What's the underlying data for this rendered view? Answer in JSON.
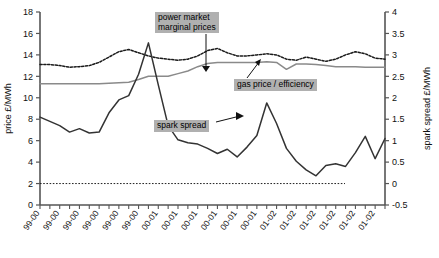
{
  "chart_data": {
    "type": "line",
    "title": "",
    "xlabel": "",
    "ylabel": "price £/MWh",
    "y2label": "spark spread £/MWh",
    "ylim": [
      0,
      18
    ],
    "y2lim": [
      -0.5,
      4
    ],
    "yticks": [
      0,
      2,
      4,
      6,
      8,
      10,
      12,
      14,
      16,
      18
    ],
    "y2ticks": [
      -0.5,
      0,
      0.5,
      1,
      1.5,
      2,
      2.5,
      3,
      3.5,
      4
    ],
    "grid": false,
    "legend_position": "inline-callouts",
    "categories": [
      "99-00",
      "99-00",
      "99-00",
      "99-00",
      "99-00",
      "99-00",
      "99-00",
      "99-00",
      "99-00",
      "99-00",
      "99-00",
      "99-00",
      "00-01",
      "00-01",
      "00-01",
      "00-01",
      "00-01",
      "00-01",
      "00-01",
      "00-01",
      "00-01",
      "00-01",
      "00-01",
      "00-01",
      "01-02",
      "01-02",
      "01-02",
      "01-02",
      "01-02",
      "01-02",
      "01-02",
      "01-02",
      "01-02",
      "01-02",
      "01-02",
      "01-02"
    ],
    "xtick_labels": [
      "99-00",
      "99-00",
      "99-00",
      "99-00",
      "99-00",
      "99-00",
      "00-01",
      "00-01",
      "00-01",
      "00-01",
      "00-01",
      "00-01",
      "01-02",
      "01-02",
      "01-02",
      "01-02",
      "01-02",
      "01-02"
    ],
    "annotations": [
      {
        "name": "power-market-marginal-prices",
        "text": "power market\nmarginal prices"
      },
      {
        "name": "gas-price-efficiency",
        "text": "gas price / efficiency"
      },
      {
        "name": "spark-spread",
        "text": "spark spread"
      }
    ],
    "reference_line": {
      "axis": "right",
      "value": 0.0,
      "style": "dotted"
    },
    "series": [
      {
        "name": "power market marginal prices",
        "axis": "left",
        "style": "dotted",
        "color": "#1a1a1a",
        "values": [
          13.1,
          13.1,
          13.0,
          12.85,
          12.9,
          13.0,
          13.3,
          13.8,
          14.3,
          14.5,
          14.2,
          13.9,
          13.7,
          13.6,
          13.5,
          13.6,
          13.9,
          14.4,
          14.6,
          14.2,
          13.9,
          13.9,
          14.0,
          14.1,
          14.0,
          13.6,
          13.5,
          13.8,
          13.6,
          13.4,
          13.6,
          14.0,
          14.3,
          14.1,
          13.7,
          13.6
        ]
      },
      {
        "name": "gas price / efficiency",
        "axis": "left",
        "style": "solid",
        "color": "#8a8a8a",
        "values": [
          11.3,
          11.3,
          11.3,
          11.3,
          11.3,
          11.3,
          11.3,
          11.35,
          11.4,
          11.45,
          11.7,
          12.0,
          12.0,
          12.0,
          12.25,
          12.5,
          12.9,
          13.2,
          13.3,
          13.3,
          13.3,
          13.3,
          13.3,
          13.35,
          13.3,
          12.65,
          13.15,
          13.15,
          13.1,
          13.0,
          12.9,
          12.9,
          12.9,
          12.85,
          12.85,
          12.85
        ]
      },
      {
        "name": "spark spread",
        "axis": "right",
        "style": "solid",
        "color": "#333333",
        "values": [
          1.55,
          1.45,
          1.35,
          1.2,
          1.28,
          1.18,
          1.2,
          1.65,
          1.95,
          2.05,
          2.55,
          3.28,
          2.3,
          1.35,
          1.02,
          0.95,
          0.92,
          0.82,
          0.7,
          0.8,
          0.62,
          0.85,
          1.12,
          1.88,
          1.4,
          0.82,
          0.52,
          0.32,
          0.18,
          0.42,
          0.46,
          0.4,
          0.72,
          1.1,
          0.58,
          1.05
        ]
      }
    ]
  },
  "callouts": {
    "power": "power market\nmarginal prices",
    "gas": "gas price / efficiency",
    "spark": "spark spread"
  },
  "axes": {
    "left_title": "price £/MWh",
    "right_title": "spark spread £/MWh"
  }
}
